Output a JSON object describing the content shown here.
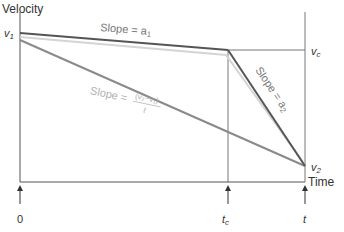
{
  "diagram": {
    "y_axis_label": "Velocity",
    "x_axis_label": "Time",
    "v1_label": "v",
    "v1_sub": "1",
    "vc_label": "v",
    "vc_sub": "c",
    "v2_label": "v",
    "v2_sub": "2",
    "slope_a1_text": "Slope = a",
    "slope_a1_sub": "1",
    "slope_a2_text": "Slope = a",
    "slope_a2_sub": "2",
    "slope_avg_text": "Slope =",
    "slope_avg_numerator": "(v₂−v₁)",
    "slope_avg_denominator": "t",
    "tick_0": "0",
    "tick_tc": "t",
    "tick_tc_sub": "c",
    "tick_t": "t",
    "colors": {
      "axis": "#555555",
      "segment_dark": "#555555",
      "average_line": "#8a8a8a",
      "light_line": "#d0d0d0",
      "slope_a1_text": "#777777",
      "slope_avg_text": "#b0b0b0",
      "slope_a2_text": "#777777"
    }
  }
}
